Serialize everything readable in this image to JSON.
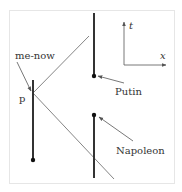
{
  "diagram": {
    "labels": {
      "me_now": "me-now",
      "p": "p",
      "putin": "Putin",
      "napoleon": "Napoleon",
      "axis_t": "t",
      "axis_x": "x"
    },
    "colors": {
      "frame": "#e6e6e6",
      "worldline": "#333333",
      "light_cone": "#666666",
      "arrow": "#555555",
      "text": "#333333"
    }
  }
}
